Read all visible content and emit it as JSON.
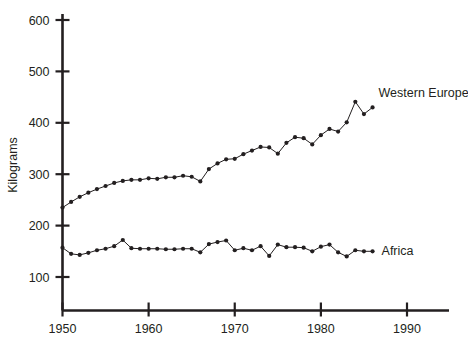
{
  "chart_data": {
    "type": "line",
    "title": "",
    "xlabel": "",
    "ylabel": "Kilograms",
    "xlim": [
      1950,
      1994
    ],
    "ylim": [
      0,
      620
    ],
    "grid": false,
    "legend_position": "inline-at-series-end",
    "y_ticks": [
      100,
      200,
      300,
      400,
      500,
      600
    ],
    "x_ticks": [
      1950,
      1960,
      1970,
      1980,
      1990
    ],
    "x_tick_labels": [
      "1950",
      "1960",
      "1970",
      "1980",
      "1990"
    ],
    "y_tick_labels": [
      "100",
      "200",
      "300",
      "400",
      "500",
      "600"
    ],
    "series": [
      {
        "name": "Western Europe",
        "label": "Western Europe",
        "x": [
          1950,
          1951,
          1952,
          1953,
          1954,
          1955,
          1956,
          1957,
          1958,
          1959,
          1960,
          1961,
          1962,
          1963,
          1964,
          1965,
          1966,
          1967,
          1968,
          1969,
          1970,
          1971,
          1972,
          1973,
          1974,
          1975,
          1976,
          1977,
          1978,
          1979,
          1980,
          1981,
          1982,
          1983,
          1984,
          1985,
          1986
        ],
        "values": [
          235,
          246,
          256,
          264,
          271,
          277,
          283,
          287,
          289,
          289,
          292,
          291,
          294,
          294,
          297,
          295,
          286,
          310,
          321,
          329,
          330,
          339,
          346,
          353,
          352,
          340,
          361,
          372,
          370,
          358,
          376,
          388,
          383,
          401,
          441,
          417,
          430
        ]
      },
      {
        "name": "Africa",
        "label": "Africa",
        "x": [
          1950,
          1951,
          1952,
          1953,
          1954,
          1955,
          1956,
          1957,
          1958,
          1959,
          1960,
          1961,
          1962,
          1963,
          1964,
          1965,
          1966,
          1967,
          1968,
          1969,
          1970,
          1971,
          1972,
          1973,
          1974,
          1975,
          1976,
          1977,
          1978,
          1979,
          1980,
          1981,
          1982,
          1983,
          1984,
          1985,
          1986
        ],
        "values": [
          157,
          145,
          143,
          147,
          152,
          155,
          160,
          172,
          156,
          155,
          155,
          155,
          154,
          154,
          155,
          155,
          148,
          164,
          168,
          171,
          152,
          156,
          152,
          160,
          141,
          163,
          158,
          158,
          157,
          150,
          159,
          163,
          148,
          140,
          152,
          150,
          150
        ]
      }
    ],
    "annotations": []
  },
  "labels": {
    "y_axis_title": "Kilograms",
    "western_europe": "Western Europe",
    "africa": "Africa"
  },
  "colors": {
    "ink": "#231f20",
    "background": "#ffffff"
  }
}
